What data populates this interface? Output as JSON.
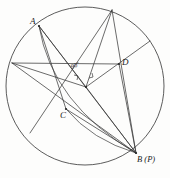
{
  "figure": {
    "background_color": "#fdfdfc",
    "stroke_color": "#3a3a3a",
    "label_color": "#1b1b1b",
    "circle": {
      "cx": 85,
      "cy": 86,
      "r": 79
    },
    "points": {
      "A": {
        "x": 39,
        "y": 26,
        "label": "A"
      },
      "B": {
        "x": 136,
        "y": 153,
        "label": "B (P)"
      },
      "C": {
        "x": 66,
        "y": 109,
        "label": "C"
      },
      "D": {
        "x": 119,
        "y": 64,
        "label": "D"
      },
      "E": {
        "x": 112,
        "y": 10,
        "label": ""
      },
      "F": {
        "x": 12,
        "y": 63,
        "label": ""
      },
      "G": {
        "x": 30,
        "y": 133,
        "label": ""
      },
      "H": {
        "x": 150,
        "y": 41,
        "label": ""
      },
      "O": {
        "x": 86,
        "y": 87,
        "label": ""
      }
    },
    "angle_marks": [
      {
        "name": "right-angle-at-center",
        "text": "90°",
        "x": 72,
        "y": 64
      }
    ],
    "segments": [
      {
        "name": "segment-A-O",
        "from": "A",
        "to": "O"
      },
      {
        "name": "segment-A-B",
        "from": "A",
        "to": "B"
      },
      {
        "name": "segment-A-C",
        "from": "A",
        "to": "C"
      },
      {
        "name": "segment-E-O",
        "from": "E",
        "to": "O"
      },
      {
        "name": "segment-E-B",
        "from": "E",
        "to": "B"
      },
      {
        "name": "segment-E-G",
        "from": "E",
        "to": "G"
      },
      {
        "name": "segment-F-O",
        "from": "F",
        "to": "O"
      },
      {
        "name": "segment-F-D",
        "from": "F",
        "to": "D"
      },
      {
        "name": "segment-F-B",
        "from": "F",
        "to": "B"
      },
      {
        "name": "segment-O-B",
        "from": "O",
        "to": "B"
      },
      {
        "name": "segment-O-H",
        "from": "O",
        "to": "H"
      },
      {
        "name": "segment-C-B",
        "from": "C",
        "to": "B"
      },
      {
        "name": "segment-D-B",
        "from": "D",
        "to": "B"
      }
    ],
    "arcs": [
      {
        "name": "arc-A-to-B",
        "from": "A",
        "to": "B"
      },
      {
        "name": "arc-C-to-B",
        "from": "C",
        "to": "B"
      }
    ]
  }
}
